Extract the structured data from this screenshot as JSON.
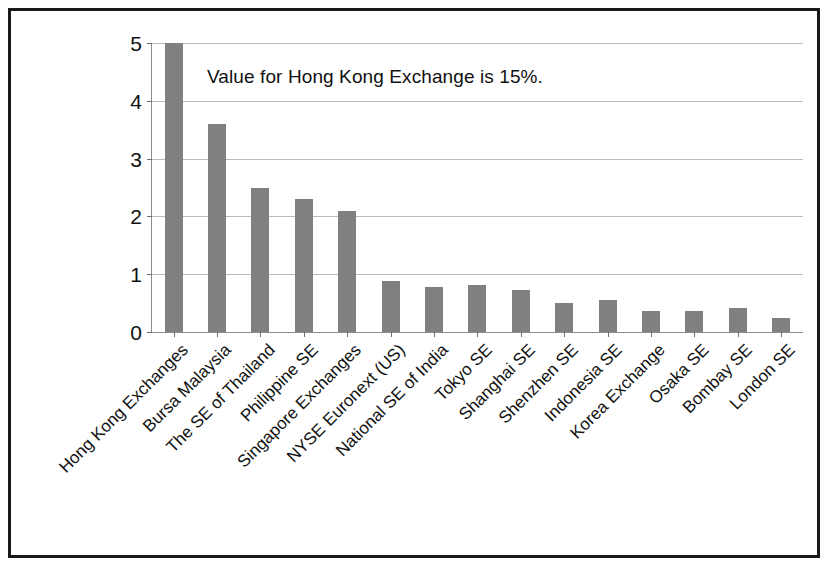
{
  "annotation": {
    "text": "Value for Hong Kong Exchange is 15%."
  },
  "axes": {
    "y_ticks": [
      "0",
      "1",
      "2",
      "3",
      "4",
      "5"
    ],
    "ylabel": "",
    "xlabel": ""
  },
  "colors": {
    "bar": "#808080",
    "gridline": "#b9b9b9",
    "axis": "#8c8c8c",
    "frame": "#1a1a1a",
    "text": "#111111"
  },
  "chart_data": {
    "type": "bar",
    "title": "",
    "subtitle": "",
    "xlabel": "",
    "ylabel": "",
    "ylim": [
      0,
      5
    ],
    "yticks": [
      0,
      1,
      2,
      3,
      4,
      5
    ],
    "grid": true,
    "legend": null,
    "annotations": [
      {
        "text": "Value for Hong Kong Exchange is 15%.",
        "note": "first bar is truncated at the axis maximum of 5"
      }
    ],
    "categories": [
      "Hong Kong Exchanges",
      "Bursa Malaysia",
      "The SE of Thailand",
      "Philippine SE",
      "Singapore Exchanges",
      "NYSE Euronext (US)",
      "National SE of India",
      "Tokyo SE",
      "Shanghai SE",
      "Shenzhen SE",
      "Indonesia SE",
      "Korea Exchange",
      "Osaka SE",
      "Bombay SE",
      "London SE"
    ],
    "values": [
      5,
      3.6,
      2.5,
      2.3,
      2.1,
      0.88,
      0.78,
      0.82,
      0.73,
      0.5,
      0.56,
      0.37,
      0.36,
      0.42,
      0.24
    ],
    "true_values": [
      15,
      3.6,
      2.5,
      2.3,
      2.1,
      0.88,
      0.78,
      0.82,
      0.73,
      0.5,
      0.56,
      0.37,
      0.36,
      0.42,
      0.24
    ]
  }
}
